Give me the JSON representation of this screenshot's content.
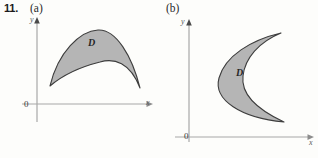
{
  "figure": {
    "problem_number": "11.",
    "background_color": "#fdfdfb",
    "region_fill_color": "#b5b5b5",
    "region_stroke_color": "#3d3d3d",
    "axis_color": "#a8a8a8"
  },
  "panels": [
    {
      "key": "a",
      "part_label": "(a)",
      "axes": {
        "y_label": "y",
        "x_label": "x",
        "origin_label": "0"
      },
      "region": {
        "label": "D",
        "description": "lens-shaped region between two downward arcs with cusps at left and right"
      }
    },
    {
      "key": "b",
      "part_label": "(b)",
      "axes": {
        "y_label": "y",
        "x_label": "x",
        "origin_label": "0"
      },
      "region": {
        "label": "D",
        "description": "crescent-shaped region opening to the right with cusps at top and bottom"
      }
    }
  ]
}
